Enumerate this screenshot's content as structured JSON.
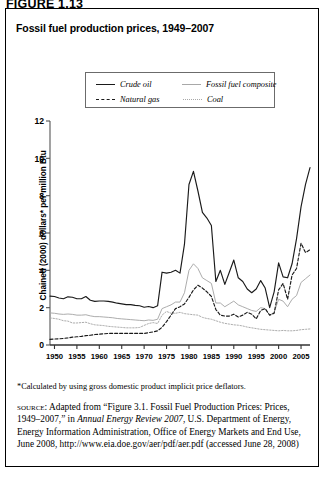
{
  "figure_label": "FIGURE 1.13",
  "chart_title": "Fossil fuel production prices, 1949–2007",
  "footnote": "*Calculated by using gross domestic product implicit price deflators.",
  "source": {
    "kicker": "source:",
    "text_1": " Adapted from “Figure 3.1. Fossil Fuel Production Prices: Prices, 1949–2007,” in ",
    "italic_1": "Annual Energy Review 2007",
    "text_2": ", U.S. Department of Energy, Energy Information Administration, Office of Energy Markets and End Use, June 2008, http://www.eia.doe.gov/aer/pdf/aer.pdf (accessed June 28, 2008)"
  },
  "legend": {
    "items": [
      {
        "label": "Crude oil",
        "style": "solid-dark",
        "color": "#1a1a1a"
      },
      {
        "label": "Fossil fuel composite",
        "style": "solid-light",
        "color": "#a8a8a8"
      },
      {
        "label": "Natural gas",
        "style": "dash-dark",
        "color": "#1a1a1a"
      },
      {
        "label": "Coal",
        "style": "dot-light",
        "color": "#a8a8a8"
      }
    ]
  },
  "chart_data": {
    "type": "line",
    "title": "Fossil fuel production prices, 1949–2007",
    "xlabel": "",
    "ylabel": "Chained (2000) dollars* per million Btu",
    "xlim": [
      1949,
      2007
    ],
    "ylim": [
      0,
      12
    ],
    "yticks": [
      0,
      2,
      4,
      6,
      8,
      10,
      12
    ],
    "xticks": [
      1950,
      1955,
      1960,
      1965,
      1970,
      1975,
      1980,
      1985,
      1990,
      1995,
      2000,
      2005
    ],
    "grid": false,
    "legend_position": "top-center",
    "x": [
      1949,
      1950,
      1951,
      1952,
      1953,
      1954,
      1955,
      1956,
      1957,
      1958,
      1959,
      1960,
      1961,
      1962,
      1963,
      1964,
      1965,
      1966,
      1967,
      1968,
      1969,
      1970,
      1971,
      1972,
      1973,
      1974,
      1975,
      1976,
      1977,
      1978,
      1979,
      1980,
      1981,
      1982,
      1983,
      1984,
      1985,
      1986,
      1987,
      1988,
      1989,
      1990,
      1991,
      1992,
      1993,
      1994,
      1995,
      1996,
      1997,
      1998,
      1999,
      2000,
      2001,
      2002,
      2003,
      2004,
      2005,
      2006,
      2007
    ],
    "series": [
      {
        "name": "Crude oil",
        "style": "solid-dark",
        "color": "#1a1a1a",
        "values": [
          2.62,
          2.6,
          2.52,
          2.48,
          2.58,
          2.56,
          2.48,
          2.48,
          2.6,
          2.4,
          2.34,
          2.36,
          2.36,
          2.34,
          2.3,
          2.24,
          2.2,
          2.16,
          2.16,
          2.12,
          2.1,
          2.02,
          2.06,
          2.0,
          2.1,
          3.9,
          3.85,
          3.9,
          4.0,
          3.85,
          5.4,
          8.6,
          9.3,
          8.25,
          7.1,
          6.8,
          6.4,
          3.4,
          4.0,
          3.25,
          3.9,
          4.55,
          3.6,
          3.4,
          3.0,
          2.8,
          3.0,
          3.45,
          3.05,
          2.0,
          2.85,
          4.4,
          3.65,
          3.6,
          4.35,
          5.7,
          7.4,
          8.6,
          9.5
        ]
      },
      {
        "name": "Fossil fuel composite",
        "style": "solid-light",
        "color": "#a8a8a8",
        "values": [
          1.72,
          1.7,
          1.66,
          1.64,
          1.66,
          1.64,
          1.6,
          1.6,
          1.62,
          1.56,
          1.52,
          1.52,
          1.5,
          1.48,
          1.46,
          1.42,
          1.4,
          1.38,
          1.36,
          1.34,
          1.32,
          1.3,
          1.34,
          1.32,
          1.38,
          1.95,
          2.05,
          2.15,
          2.3,
          2.3,
          2.8,
          4.0,
          4.35,
          4.1,
          3.6,
          3.45,
          3.3,
          2.25,
          2.25,
          2.05,
          2.2,
          2.35,
          2.15,
          2.05,
          1.95,
          1.85,
          1.8,
          2.0,
          1.95,
          1.6,
          1.75,
          2.45,
          2.35,
          2.05,
          2.45,
          2.65,
          3.35,
          3.55,
          3.75
        ]
      },
      {
        "name": "Natural gas",
        "style": "dash-dark",
        "color": "#1a1a1a",
        "values": [
          0.3,
          0.32,
          0.33,
          0.35,
          0.38,
          0.42,
          0.44,
          0.46,
          0.5,
          0.52,
          0.56,
          0.58,
          0.6,
          0.62,
          0.62,
          0.62,
          0.62,
          0.62,
          0.62,
          0.62,
          0.62,
          0.62,
          0.66,
          0.7,
          0.76,
          0.95,
          1.25,
          1.6,
          1.95,
          2.05,
          2.2,
          2.55,
          2.95,
          3.2,
          3.05,
          2.85,
          2.6,
          1.9,
          1.6,
          1.55,
          1.55,
          1.65,
          1.5,
          1.6,
          1.75,
          1.65,
          1.4,
          1.85,
          1.95,
          1.6,
          1.7,
          2.95,
          3.3,
          2.45,
          3.75,
          4.1,
          5.45,
          4.95,
          5.1
        ]
      },
      {
        "name": "Coal",
        "style": "dot-light",
        "color": "#a8a8a8",
        "values": [
          1.45,
          1.42,
          1.38,
          1.3,
          1.28,
          1.18,
          1.18,
          1.2,
          1.22,
          1.14,
          1.08,
          1.06,
          1.04,
          1.0,
          0.98,
          0.96,
          0.94,
          0.92,
          0.92,
          0.92,
          0.94,
          1.05,
          1.15,
          1.2,
          1.15,
          1.6,
          1.8,
          1.7,
          1.7,
          1.75,
          1.68,
          1.65,
          1.62,
          1.6,
          1.48,
          1.42,
          1.38,
          1.3,
          1.22,
          1.16,
          1.12,
          1.08,
          1.06,
          1.02,
          0.96,
          0.92,
          0.88,
          0.84,
          0.82,
          0.8,
          0.78,
          0.76,
          0.78,
          0.76,
          0.76,
          0.78,
          0.82,
          0.84,
          0.86
        ]
      }
    ]
  }
}
